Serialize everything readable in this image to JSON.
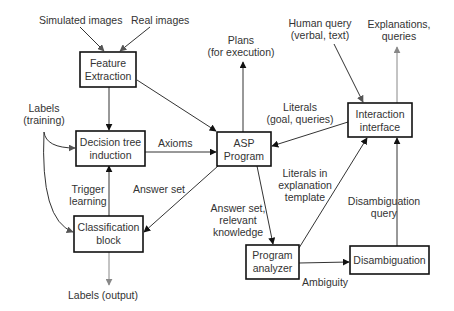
{
  "diagram": {
    "nodes": {
      "feature_extraction": {
        "line1": "Feature",
        "line2": "Extraction"
      },
      "decision_tree": {
        "line1": "Decision tree",
        "line2": "induction"
      },
      "classification": {
        "line1": "Classification",
        "line2": "block"
      },
      "asp_program": {
        "line1": "ASP",
        "line2": "Program"
      },
      "interaction": {
        "line1": "Interaction",
        "line2": "interface"
      },
      "program_analyzer": {
        "line1": "Program",
        "line2": "analyzer"
      },
      "disambiguation": {
        "line1": "Disambiguation"
      }
    },
    "labels": {
      "simulated_images": "Simulated images",
      "real_images": "Real images",
      "labels_training_1": "Labels",
      "labels_training_2": "(training)",
      "axioms": "Axioms",
      "trigger_1": "Trigger",
      "trigger_2": "learning",
      "answer_set": "Answer set",
      "labels_output": "Labels (output)",
      "plans_1": "Plans",
      "plans_2": "(for execution)",
      "literals_1": "Literals",
      "literals_2": "(goal, queries)",
      "human_query_1": "Human query",
      "human_query_2": "(verbal, text)",
      "explanations_1": "Explanations,",
      "explanations_2": "queries",
      "literals_expl_1": "Literals in",
      "literals_expl_2": "explanation",
      "literals_expl_3": "template",
      "answer_relevant_1": "Answer set,",
      "answer_relevant_2": "relevant",
      "answer_relevant_3": "knowledge",
      "disamb_query_1": "Disambiguation",
      "disamb_query_2": "query",
      "ambiguity": "Ambiguity"
    },
    "colors": {
      "box_stroke": "#111111",
      "edge": "#333333",
      "edge_output": "#888888",
      "text": "#333333"
    }
  }
}
